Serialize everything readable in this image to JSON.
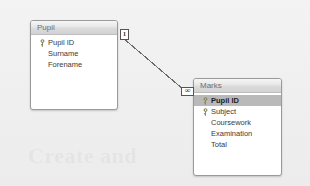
{
  "diagram": {
    "background_color": "#f1f1f1",
    "watermark_text": "Create and",
    "line_color": "#6b6b6b"
  },
  "tables": [
    {
      "name": "Pupil",
      "x": 30,
      "y": 20,
      "width": 88,
      "height": 90,
      "fields": [
        {
          "label": "Pupil ID",
          "is_key": true,
          "selected": false
        },
        {
          "label": "Surname",
          "is_key": false,
          "selected": false
        },
        {
          "label": "Forename",
          "is_key": false,
          "selected": false
        }
      ]
    },
    {
      "name": "Marks",
      "x": 193,
      "y": 78,
      "width": 89,
      "height": 98,
      "fields": [
        {
          "label": "Pupil ID",
          "is_key": true,
          "selected": true
        },
        {
          "label": "Subject",
          "is_key": true,
          "selected": false
        },
        {
          "label": "Coursework",
          "is_key": false,
          "selected": false
        },
        {
          "label": "Examination",
          "is_key": false,
          "selected": false
        },
        {
          "label": "Total",
          "is_key": false,
          "selected": false
        }
      ]
    }
  ],
  "relationship": {
    "from_table": "Pupil",
    "from_field": "Pupil ID",
    "to_table": "Marks",
    "to_field": "Pupil ID",
    "one_side_label": "1",
    "many_side_label": "∞",
    "path": {
      "x1": 123,
      "y1": 38,
      "x2": 184,
      "y2": 90
    }
  }
}
